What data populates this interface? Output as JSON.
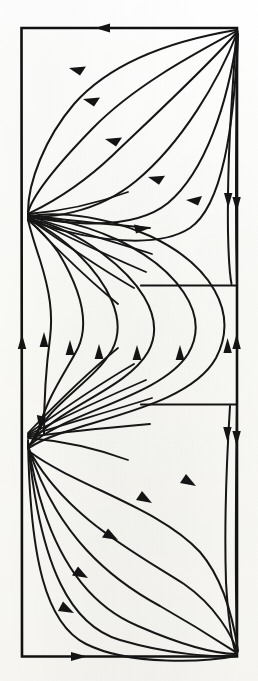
{
  "figure": {
    "kind": "phase-portrait",
    "title": "Phase portrait of a planar flow on a rectangular domain",
    "background_color": "#fdfdfb",
    "ink_color": "#161616",
    "caption": ""
  },
  "frame": {
    "name": "domain-boundary",
    "x": 21,
    "y": 27,
    "width": 216,
    "height": 630,
    "stroke_width": 2.4,
    "corners": {
      "top_left": [
        21,
        27
      ],
      "top_right": [
        237,
        27
      ],
      "bottom_right": [
        237,
        657
      ],
      "bottom_left": [
        21,
        657
      ]
    }
  },
  "critical_points": [
    {
      "name": "upper-left-node",
      "type": "degenerate-node",
      "x": 28,
      "y": 214,
      "on_boundary": "left"
    },
    {
      "name": "lower-left-node",
      "type": "degenerate-node",
      "x": 28,
      "y": 438,
      "on_boundary": "left"
    },
    {
      "name": "top-right-sink",
      "type": "sink",
      "x": 237,
      "y": 29,
      "on_boundary": "top-right"
    },
    {
      "name": "bottom-right-sink",
      "type": "sink",
      "x": 237,
      "y": 655,
      "on_boundary": "bottom-right"
    }
  ],
  "separatrices": [
    {
      "name": "upper-separatrix",
      "y": 285,
      "x_from": 140,
      "x_to": 237
    },
    {
      "name": "lower-separatrix",
      "y": 404,
      "x_from": 140,
      "x_to": 237
    }
  ],
  "boundary_flow": [
    {
      "name": "top-edge-flow",
      "edge": "top",
      "direction": "leftward",
      "arrow_at": [
        105,
        28
      ]
    },
    {
      "name": "bottom-edge-flow",
      "edge": "bottom",
      "direction": "rightward",
      "arrow_at": [
        80,
        656
      ]
    },
    {
      "name": "left-edge-flow",
      "edge": "left",
      "direction": "upward",
      "arrow_at": [
        22,
        350
      ]
    },
    {
      "name": "right-edge-upper",
      "edge": "right",
      "direction": "downward",
      "arrow_at": [
        236,
        205
      ]
    },
    {
      "name": "right-edge-lower",
      "edge": "right",
      "direction": "upward",
      "arrow_at": [
        236,
        348
      ]
    }
  ],
  "regions": [
    {
      "name": "upper-cell",
      "y_from": 27,
      "y_to": 285,
      "flow": "right-to-left along arcs, into upper-left node"
    },
    {
      "name": "middle-cell",
      "y_from": 285,
      "y_to": 404,
      "flow": "upward, S-shaped trajectories"
    },
    {
      "name": "lower-cell",
      "y_from": 404,
      "y_to": 657,
      "flow": "left-to-right along arcs, into bottom-right sink"
    }
  ],
  "counts": {
    "upper_arcs": 6,
    "middle_arcs": 6,
    "lower_arcs": 6,
    "total_arrowheads": 26
  }
}
